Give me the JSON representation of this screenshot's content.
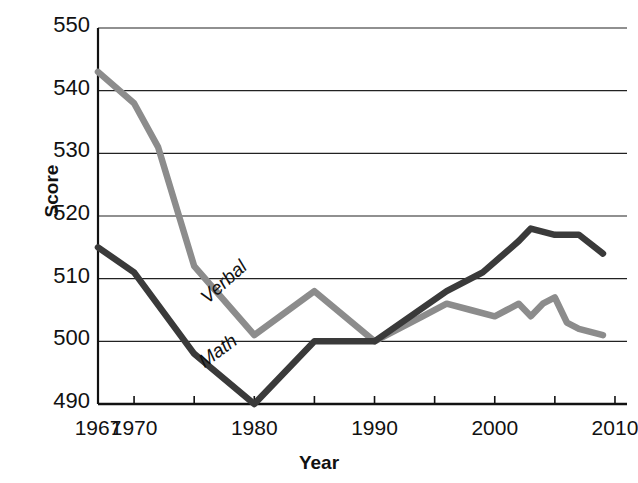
{
  "chart_data": {
    "type": "line",
    "title": "",
    "xlabel": "Year",
    "ylabel": "Score",
    "xlim": [
      1967,
      2011
    ],
    "ylim": [
      490,
      550
    ],
    "grid": true,
    "grid_axis": "y",
    "legend_position": "inline-labels",
    "y_ticks": [
      550,
      540,
      530,
      520,
      510,
      500,
      490
    ],
    "x_ticks": [
      1967,
      1970,
      1975,
      1980,
      1985,
      1990,
      1995,
      2000,
      2005,
      2010
    ],
    "x_tick_labels": [
      "1967",
      "1970",
      "",
      "1980",
      "",
      "1990",
      "",
      "2000",
      "",
      "2010"
    ],
    "series": [
      {
        "name": "Verbal",
        "color": "#8c8c8c",
        "label_x": 1977.5,
        "label_y": 509.5,
        "label_rotation": -42,
        "x": [
          1967,
          1970,
          1972,
          1975,
          1980,
          1985,
          1990,
          1992,
          1994,
          1996,
          1998,
          2000,
          2001,
          2002,
          2003,
          2004,
          2005,
          2006,
          2007,
          2009
        ],
        "values": [
          543,
          538,
          531,
          512,
          501,
          508,
          500,
          502,
          504,
          506,
          505,
          504,
          505,
          506,
          504,
          506,
          507,
          503,
          502,
          501
        ]
      },
      {
        "name": "Math",
        "color": "#3a3a3a",
        "label_x": 1977.0,
        "label_y": 498.5,
        "label_rotation": -36,
        "x": [
          1967,
          1970,
          1975,
          1980,
          1985,
          1990,
          1996,
          1999,
          2002,
          2003,
          2005,
          2006,
          2007,
          2009
        ],
        "values": [
          515,
          511,
          498,
          490,
          500,
          500,
          508,
          511,
          516,
          518,
          517,
          517,
          517,
          514
        ]
      }
    ]
  },
  "axes": {
    "y_title": "Score",
    "x_title": "Year"
  }
}
